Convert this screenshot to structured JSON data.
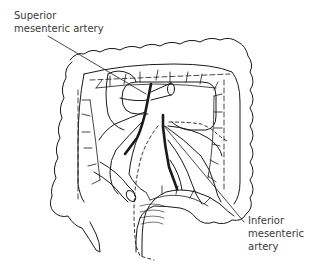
{
  "diagram": {
    "labels": [
      {
        "id": "superior",
        "line1": "Superior",
        "line2": "mesenteric artery"
      },
      {
        "id": "inferior",
        "line1": "Inferior",
        "line2": "mesenteric",
        "line3": "artery"
      }
    ],
    "colors": {
      "ink": "#1a1a1a",
      "label": "#3a3a3a",
      "background": "#ffffff"
    }
  }
}
